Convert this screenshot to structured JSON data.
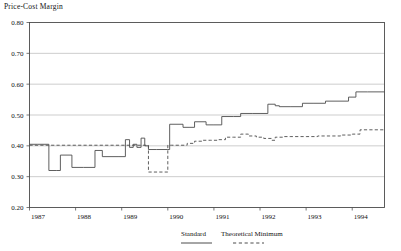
{
  "chart_data": {
    "type": "line",
    "title": "Price-Cost Margin",
    "xlabel": "",
    "ylabel": "",
    "grid": true,
    "grid_axis": "y",
    "legend_position": "bottom",
    "xlim": [
      1987.0,
      1994.7
    ],
    "ylim": [
      0.2,
      0.8
    ],
    "yticks": [
      "0.20",
      "0.30",
      "0.40",
      "0.50",
      "0.60",
      "0.70",
      "0.80"
    ],
    "ytick_values": [
      0.2,
      0.3,
      0.4,
      0.5,
      0.6,
      0.7,
      0.8
    ],
    "xticks": [
      "1987",
      "1988",
      "1989",
      "1990",
      "1991",
      "1992",
      "1993",
      "1994"
    ],
    "xtick_values": [
      1987,
      1988,
      1989,
      1990,
      1991,
      1992,
      1993,
      1994
    ],
    "drawstyle": "steps-post",
    "series": [
      {
        "name": "Standard",
        "style": "solid",
        "color": "#4d4d4d",
        "x": [
          1987.0,
          1987.17,
          1987.42,
          1987.58,
          1987.67,
          1987.92,
          1988.17,
          1988.42,
          1988.58,
          1988.92,
          1989.08,
          1989.17,
          1989.25,
          1989.33,
          1989.42,
          1989.5,
          1989.58,
          1989.75,
          1990.0,
          1990.04,
          1990.33,
          1990.46,
          1990.58,
          1990.83,
          1991.0,
          1991.17,
          1991.42,
          1991.58,
          1991.83,
          1992.0,
          1992.17,
          1992.33,
          1992.42,
          1992.67,
          1992.92,
          1993.17,
          1993.42,
          1993.67,
          1993.92,
          1994.08,
          1994.33,
          1994.7
        ],
        "values": [
          0.405,
          0.405,
          0.32,
          0.32,
          0.37,
          0.33,
          0.33,
          0.385,
          0.365,
          0.365,
          0.42,
          0.395,
          0.405,
          0.395,
          0.425,
          0.4,
          0.388,
          0.388,
          0.388,
          0.47,
          0.46,
          0.46,
          0.478,
          0.468,
          0.468,
          0.495,
          0.495,
          0.505,
          0.505,
          0.505,
          0.535,
          0.53,
          0.527,
          0.527,
          0.538,
          0.538,
          0.545,
          0.545,
          0.558,
          0.575,
          0.575,
          0.575
        ]
      },
      {
        "name": "Theoretical Minimum",
        "style": "dashed",
        "color": "#4d4d4d",
        "x": [
          1987.0,
          1989.35,
          1989.42,
          1989.5,
          1989.58,
          1989.96,
          1990.0,
          1990.08,
          1990.25,
          1990.42,
          1990.58,
          1990.75,
          1990.92,
          1991.08,
          1991.25,
          1991.42,
          1991.58,
          1991.75,
          1991.92,
          1992.08,
          1992.25,
          1992.33,
          1992.5,
          1992.67,
          1992.83,
          1993.0,
          1993.25,
          1993.5,
          1993.75,
          1994.0,
          1994.17,
          1994.33,
          1994.7
        ],
        "values": [
          0.402,
          0.402,
          0.402,
          0.402,
          0.315,
          0.315,
          0.402,
          0.402,
          0.402,
          0.408,
          0.415,
          0.418,
          0.418,
          0.42,
          0.428,
          0.428,
          0.438,
          0.432,
          0.428,
          0.424,
          0.418,
          0.428,
          0.43,
          0.43,
          0.43,
          0.43,
          0.432,
          0.432,
          0.435,
          0.438,
          0.452,
          0.452,
          0.452
        ]
      }
    ]
  },
  "legend": {
    "items": [
      {
        "label": "Standard",
        "style": "solid"
      },
      {
        "label": "Theoretical Minimum",
        "style": "dashed"
      }
    ]
  }
}
